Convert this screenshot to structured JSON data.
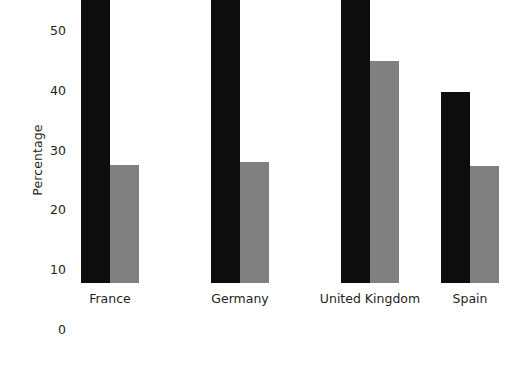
{
  "chart_data": {
    "type": "bar",
    "title": "",
    "xlabel": "",
    "ylabel": "Percentage",
    "categories": [
      "France",
      "Germany",
      "United Kingdom",
      "Spain"
    ],
    "ylim": [
      0,
      55
    ],
    "yticks": [
      0,
      10,
      20,
      30,
      40,
      50
    ],
    "ytick_labels": [
      "0",
      "10",
      "20",
      "30",
      "40",
      "50"
    ],
    "grid": false,
    "legend": "none",
    "series": [
      {
        "name": "series-1",
        "color": "#0d0d0d",
        "values": [
          50.0,
          49.8,
          52.6,
          32.0
        ]
      },
      {
        "name": "series-2",
        "color": "#808080",
        "values": [
          19.7,
          20.2,
          37.1,
          19.6
        ]
      }
    ]
  },
  "colors": {
    "background": "#ffffff",
    "text": "#231f20",
    "series_dark": "#0d0d0d",
    "series_gray": "#808080"
  }
}
